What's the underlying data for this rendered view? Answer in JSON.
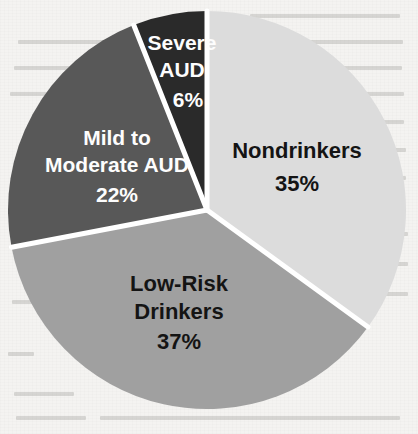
{
  "page": {
    "background_color": "#f4f3f1"
  },
  "chart_data": {
    "type": "pie",
    "title": "",
    "subtitle": "",
    "xlabel": "",
    "ylabel": "",
    "legend_position": "none",
    "grid": false,
    "labels_inside_slices": true,
    "start_angle_deg": 0,
    "direction": "clockwise",
    "categories": [
      "Nondrinkers",
      "Low-Risk Drinkers",
      "Mild to Moderate AUD",
      "Severe AUD"
    ],
    "values": [
      35,
      37,
      22,
      6
    ],
    "value_suffix": "%",
    "slices": [
      {
        "label": "Nondrinkers",
        "label_line1": "Nondrinkers",
        "label_line2": "",
        "value": 35,
        "value_text": "35%",
        "color": "#dcdcdc",
        "text_color": "#141414",
        "start_deg": 0,
        "end_deg": 126
      },
      {
        "label": "Low-Risk Drinkers",
        "label_line1": "Low-Risk",
        "label_line2": "Drinkers",
        "value": 37,
        "value_text": "37%",
        "color": "#a0a0a0",
        "text_color": "#141414",
        "start_deg": 126,
        "end_deg": 259.2
      },
      {
        "label": "Mild to Moderate AUD",
        "label_line1": "Mild to",
        "label_line2": "Moderate AUD",
        "value": 22,
        "value_text": "22%",
        "color": "#585858",
        "text_color": "#fdfdfd",
        "start_deg": 259.2,
        "end_deg": 338.4
      },
      {
        "label": "Severe AUD",
        "label_line1": "Severe",
        "label_line2": "AUD",
        "value": 6,
        "value_text": "6%",
        "color": "#2a2a2a",
        "text_color": "#fdfdfd",
        "start_deg": 338.4,
        "end_deg": 360
      }
    ],
    "separator_color": "#ffffff",
    "total": 100
  }
}
